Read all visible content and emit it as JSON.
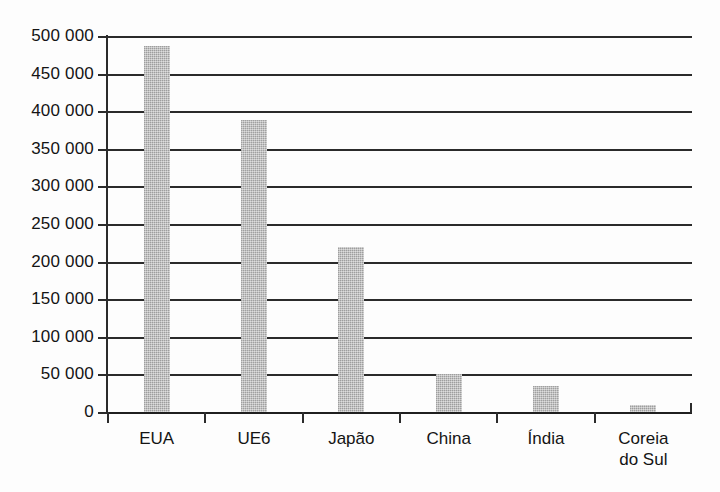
{
  "chart_data": {
    "type": "bar",
    "title": "",
    "subtitle": "",
    "xlabel": "",
    "ylabel": "",
    "categories": [
      "EUA",
      "UE6",
      "Japão",
      "China",
      "Índia",
      "Coreia do Sul"
    ],
    "category_lines": [
      [
        "EUA"
      ],
      [
        "UE6"
      ],
      [
        "Japão"
      ],
      [
        "China"
      ],
      [
        "Índia"
      ],
      [
        "Coreia",
        "do Sul"
      ]
    ],
    "values": [
      487000,
      388000,
      220000,
      50000,
      34000,
      9000
    ],
    "ylim": [
      0,
      500000
    ],
    "ytick_step": 50000,
    "yticks": [
      0,
      50000,
      100000,
      150000,
      200000,
      250000,
      300000,
      350000,
      400000,
      450000,
      500000
    ],
    "ytick_labels": [
      "0",
      "50 000",
      "100 000",
      "150 000",
      "200 000",
      "250 000",
      "300 000",
      "350 000",
      "400 000",
      "450 000",
      "500 000"
    ],
    "grid": true,
    "grid_axis": "y",
    "legend": false,
    "legend_position": "none",
    "bar_color": "#b4b4b4",
    "axis_color": "#2b2b2b",
    "text_color": "#141414",
    "background_color": "#ffffff"
  },
  "axes": {
    "y_axis_name": "y-axis",
    "x_axis_name": "x-axis"
  }
}
